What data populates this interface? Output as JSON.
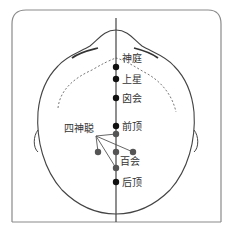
{
  "figure": {
    "midline_points": [
      {
        "label": "神庭",
        "x": 116,
        "y": 67
      },
      {
        "label": "上星",
        "x": 116,
        "y": 79
      },
      {
        "label": "囟会",
        "x": 116,
        "y": 98
      },
      {
        "label": "前顶",
        "x": 116,
        "y": 126
      },
      {
        "label": "百会",
        "x": 116,
        "y": 152
      },
      {
        "label": "后顶",
        "x": 116,
        "y": 182
      }
    ],
    "group_label": "四神聪",
    "group_points": [
      {
        "x": 116,
        "y": 134
      },
      {
        "x": 98,
        "y": 152
      },
      {
        "x": 133,
        "y": 152
      },
      {
        "x": 116,
        "y": 168
      }
    ],
    "colors": {
      "line": "#333333",
      "point_primary": "#111111",
      "point_secondary": "#555555",
      "frame": "#888888"
    }
  }
}
